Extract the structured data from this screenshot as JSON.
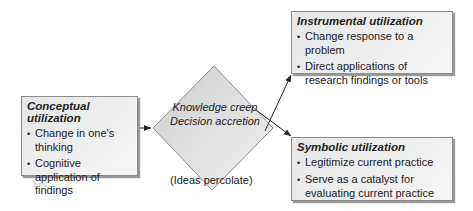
{
  "diagram": {
    "conceptual": {
      "title": "Conceptual utilization",
      "items": [
        "Change in one's thinking",
        "Cognitive application of findings"
      ]
    },
    "center": {
      "line1": "Knowledge creep",
      "line2": "Decision accretion",
      "caption": "(Ideas percolate)"
    },
    "instrumental": {
      "title": "Instrumental utilization",
      "items": [
        "Change response to a problem",
        "Direct applications of research findings or tools"
      ]
    },
    "symbolic": {
      "title": "Symbolic utilization",
      "items": [
        "Legitimize current practice",
        "Serve as a catalyst for evaluating current practice"
      ]
    },
    "margin_mark": "hrs",
    "colors": {
      "box_fill": "#ececec",
      "border": "#8a8a8a",
      "diamond_fill": "#dcdcdc",
      "arrow": "#222222"
    }
  }
}
